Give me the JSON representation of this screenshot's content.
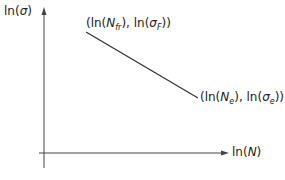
{
  "diagram": {
    "type": "log-log S-N plot",
    "y_axis": {
      "label_prefix": "ln(",
      "symbol": "σ",
      "label_suffix": ")"
    },
    "x_axis": {
      "label_prefix": "ln(",
      "symbol": "N",
      "label_suffix": ")"
    },
    "point_start": {
      "open": "(ln(",
      "n": "N",
      "n_sub": "fr",
      "mid": "), ln(",
      "s": "σ",
      "s_sub": "F",
      "close": "))"
    },
    "point_end": {
      "open": "(ln(",
      "n": "N",
      "n_sub": "e",
      "mid": "), ln(",
      "s": "σ",
      "s_sub": "e",
      "close": "))"
    },
    "line_color": "#333333",
    "axis_color": "#444444"
  }
}
